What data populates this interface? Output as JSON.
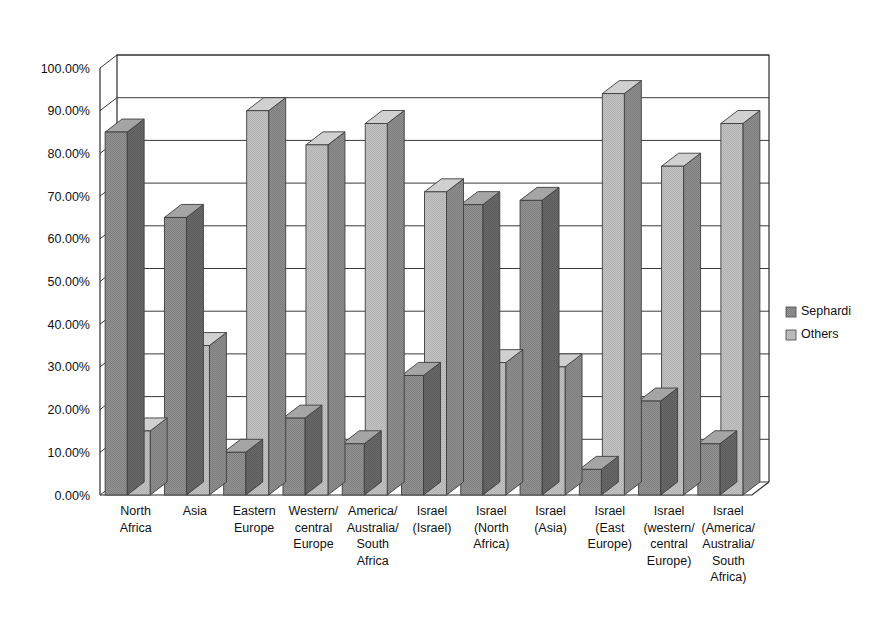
{
  "chart_data": {
    "type": "bar",
    "title": "",
    "subtitle": "",
    "xlabel": "",
    "ylabel": "",
    "ylim": [
      0,
      100
    ],
    "y_unit": "%",
    "grid": true,
    "legend_position": "right",
    "style": "3d-clustered-column",
    "tick_labels": [
      "0.00%",
      "10.00%",
      "20.00%",
      "30.00%",
      "40.00%",
      "50.00%",
      "60.00%",
      "70.00%",
      "80.00%",
      "90.00%",
      "100.00%"
    ],
    "tick_values": [
      0,
      10,
      20,
      30,
      40,
      50,
      60,
      70,
      80,
      90,
      100
    ],
    "categories": [
      "North Africa",
      "Asia",
      "Eastern Europe",
      "Western/central Europe",
      "America/Australia/ South Africa",
      "Israel (Israel)",
      "Israel (North Africa)",
      "Israel (Asia)",
      "Israel (East Europe)",
      "Israel (western/central Europe)",
      "Israel (America/Australia/ South Africa)"
    ],
    "category_lines": [
      [
        "North",
        "Africa"
      ],
      [
        "Asia"
      ],
      [
        "Eastern",
        "Europe"
      ],
      [
        "Western/",
        "central",
        "Europe"
      ],
      [
        "America/",
        "Australia/",
        "South",
        "Africa"
      ],
      [
        "Israel",
        "(Israel)"
      ],
      [
        "Israel",
        "(North",
        "Africa)"
      ],
      [
        "Israel",
        "(Asia)"
      ],
      [
        "Israel",
        "(East",
        "Europe)"
      ],
      [
        "Israel",
        "(western/",
        "central",
        "Europe)"
      ],
      [
        "Israel",
        "(America/",
        "Australia/",
        "South",
        "Africa)"
      ]
    ],
    "series": [
      {
        "name": "Sephardi",
        "color": "#8f8f8f",
        "values": [
          85,
          65,
          10,
          18,
          12,
          28,
          68,
          69,
          6,
          22,
          12
        ]
      },
      {
        "name": "Others",
        "color": "#bdbdbd",
        "values": [
          15,
          35,
          90,
          82,
          87,
          71,
          31,
          30,
          94,
          77,
          87
        ]
      }
    ]
  },
  "legend": {
    "items": [
      {
        "label": "Sephardi",
        "swatch_color": "#8f8f8f"
      },
      {
        "label": "Others",
        "swatch_color": "#bdbdbd"
      }
    ]
  },
  "colors": {
    "sephardi": "#8f8f8f",
    "others": "#bdbdbd",
    "axis": "#2b2b2b",
    "grid": "#3a3a3a",
    "background": "#ffffff",
    "text": "#111111"
  }
}
